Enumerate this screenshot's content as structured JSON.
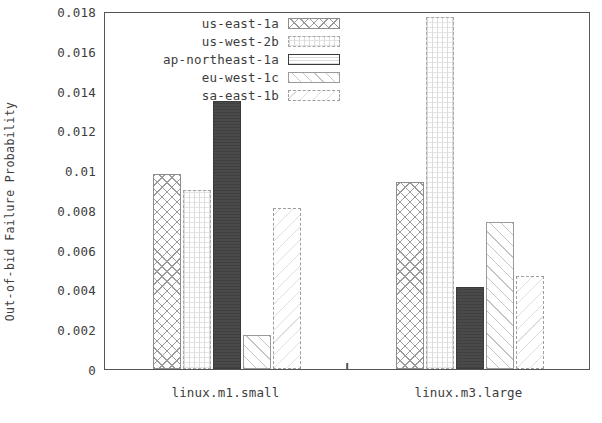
{
  "chart_data": {
    "type": "bar",
    "title": "",
    "xlabel": "",
    "ylabel": "Out-of-bid Failure Probability",
    "categories": [
      "linux.m1.small",
      "linux.m3.large"
    ],
    "ylim": [
      0,
      0.018
    ],
    "ytick_labels": [
      "0.018",
      "0.016",
      "0.014",
      "0.012",
      "0.01",
      "0.008",
      "0.006",
      "0.004",
      "0.002",
      "0"
    ],
    "ytick_values": [
      0.018,
      0.016,
      0.014,
      0.012,
      0.01,
      0.008,
      0.006,
      0.004,
      0.002,
      0
    ],
    "grid": false,
    "legend_position": "top-center",
    "series": [
      {
        "name": "us-east-1a",
        "pattern": "cross-hatch",
        "values": [
          0.0098,
          0.0094
        ]
      },
      {
        "name": "us-west-2b",
        "pattern": "light-dotted",
        "values": [
          0.009,
          0.0177
        ]
      },
      {
        "name": "ap-northeast-1a",
        "pattern": "solid-dark",
        "values": [
          0.0135,
          0.0041
        ]
      },
      {
        "name": "eu-west-1c",
        "pattern": "sparse-diagonal",
        "values": [
          0.0017,
          0.0074
        ]
      },
      {
        "name": "sa-east-1b",
        "pattern": "dash-dot-outline",
        "values": [
          0.0081,
          0.0047
        ]
      }
    ]
  },
  "axis": {
    "y_title": "Out-of-bid Failure Probability"
  }
}
